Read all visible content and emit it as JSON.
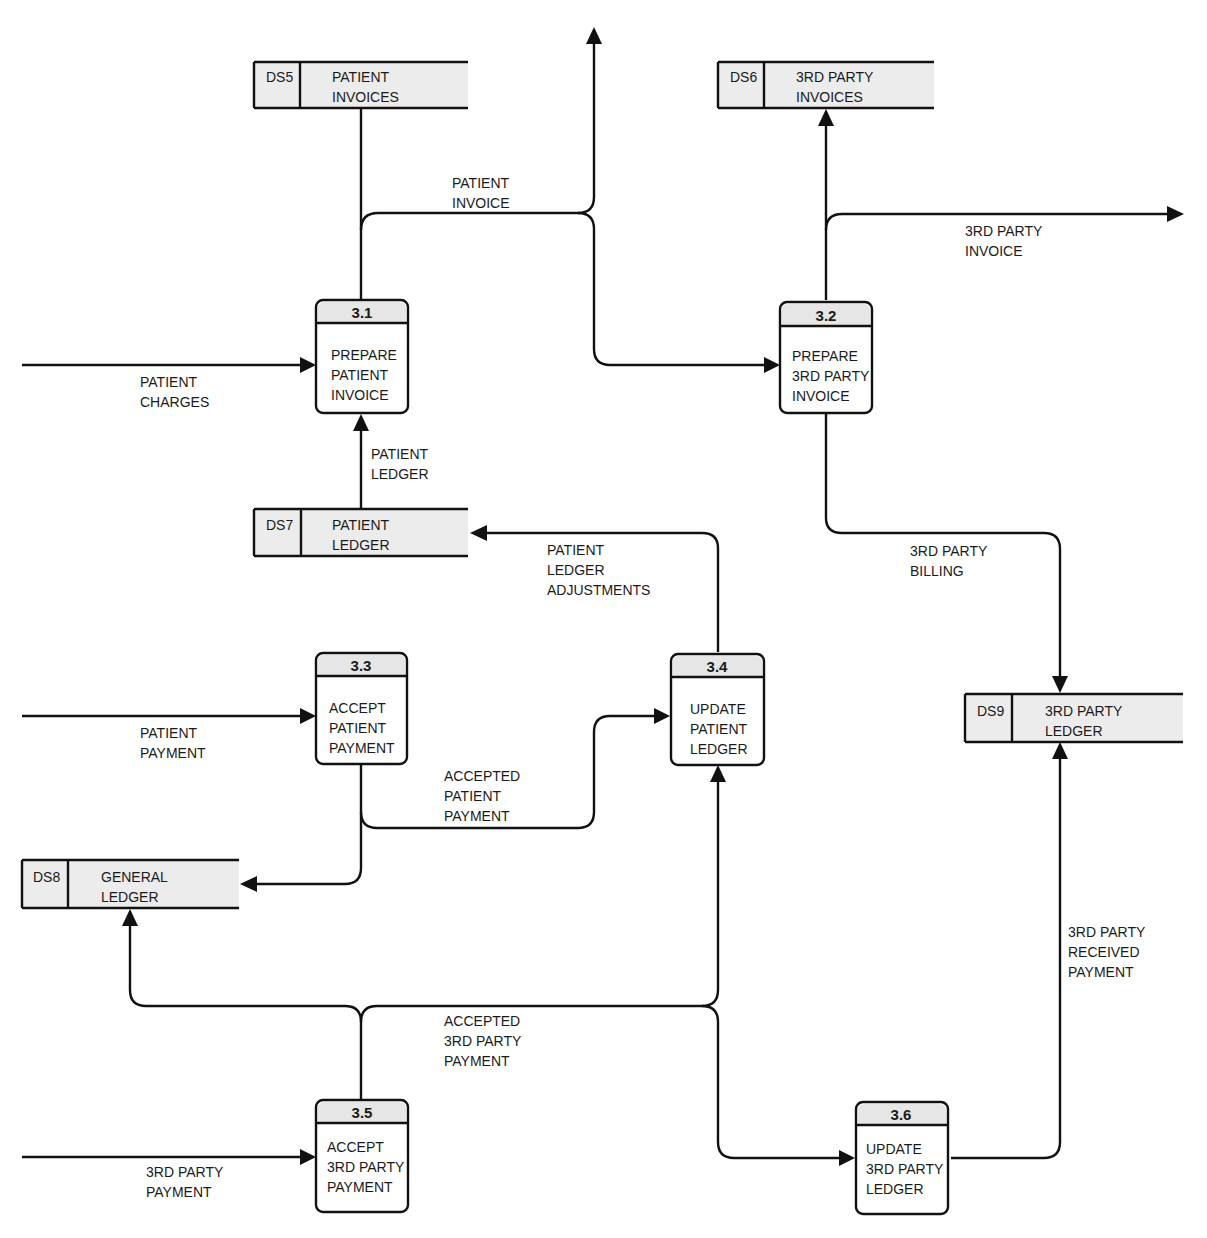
{
  "diagram": {
    "type": "data-flow-diagram",
    "processes": [
      {
        "id": "3.1",
        "lines": [
          "PREPARE",
          "PATIENT",
          "INVOICE"
        ]
      },
      {
        "id": "3.2",
        "lines": [
          "PREPARE",
          "3RD PARTY",
          "INVOICE"
        ]
      },
      {
        "id": "3.3",
        "lines": [
          "ACCEPT",
          "PATIENT",
          "PAYMENT"
        ]
      },
      {
        "id": "3.4",
        "lines": [
          "UPDATE",
          "PATIENT",
          "LEDGER"
        ]
      },
      {
        "id": "3.5",
        "lines": [
          "ACCEPT",
          "3RD PARTY",
          "PAYMENT"
        ]
      },
      {
        "id": "3.6",
        "lines": [
          "UPDATE",
          "3RD PARTY",
          "LEDGER"
        ]
      }
    ],
    "data_stores": [
      {
        "id": "DS5",
        "lines": [
          "PATIENT",
          "INVOICES"
        ]
      },
      {
        "id": "DS6",
        "lines": [
          "3RD PARTY",
          "INVOICES"
        ]
      },
      {
        "id": "DS7",
        "lines": [
          "PATIENT",
          "LEDGER"
        ]
      },
      {
        "id": "DS8",
        "lines": [
          "GENERAL",
          "LEDGER"
        ]
      },
      {
        "id": "DS9",
        "lines": [
          "3RD PARTY",
          "LEDGER"
        ]
      }
    ],
    "flows": [
      {
        "name": "patient-invoice",
        "lines": [
          "PATIENT",
          "INVOICE"
        ]
      },
      {
        "name": "third-party-invoice",
        "lines": [
          "3RD PARTY",
          "INVOICE"
        ]
      },
      {
        "name": "patient-charges",
        "lines": [
          "PATIENT",
          "CHARGES"
        ]
      },
      {
        "name": "patient-ledger",
        "lines": [
          "PATIENT",
          "LEDGER"
        ]
      },
      {
        "name": "patient-ledger-adjustments",
        "lines": [
          "PATIENT",
          "LEDGER",
          "ADJUSTMENTS"
        ]
      },
      {
        "name": "third-party-billing",
        "lines": [
          "3RD PARTY",
          "BILLING"
        ]
      },
      {
        "name": "patient-payment",
        "lines": [
          "PATIENT",
          "PAYMENT"
        ]
      },
      {
        "name": "accepted-patient-payment",
        "lines": [
          "ACCEPTED",
          "PATIENT",
          "PAYMENT"
        ]
      },
      {
        "name": "third-party-received-payment",
        "lines": [
          "3RD PARTY",
          "RECEIVED",
          "PAYMENT"
        ]
      },
      {
        "name": "accepted-third-party-payment",
        "lines": [
          "ACCEPTED",
          "3RD PARTY",
          "PAYMENT"
        ]
      },
      {
        "name": "third-party-payment",
        "lines": [
          "3RD PARTY",
          "PAYMENT"
        ]
      }
    ]
  }
}
